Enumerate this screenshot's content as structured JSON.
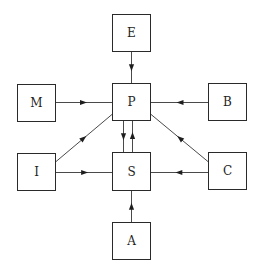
{
  "diagram": {
    "type": "directed-graph",
    "nodes": [
      {
        "id": "E",
        "label": "E"
      },
      {
        "id": "M",
        "label": "M"
      },
      {
        "id": "P",
        "label": "P"
      },
      {
        "id": "B",
        "label": "B"
      },
      {
        "id": "I",
        "label": "I"
      },
      {
        "id": "S",
        "label": "S"
      },
      {
        "id": "C",
        "label": "C"
      },
      {
        "id": "A",
        "label": "A"
      }
    ],
    "edges": [
      {
        "from": "E",
        "to": "P"
      },
      {
        "from": "M",
        "to": "P"
      },
      {
        "from": "B",
        "to": "P"
      },
      {
        "from": "P",
        "to": "S"
      },
      {
        "from": "S",
        "to": "P"
      },
      {
        "from": "I",
        "to": "P"
      },
      {
        "from": "C",
        "to": "P"
      },
      {
        "from": "I",
        "to": "S"
      },
      {
        "from": "C",
        "to": "S"
      },
      {
        "from": "A",
        "to": "S"
      }
    ]
  }
}
